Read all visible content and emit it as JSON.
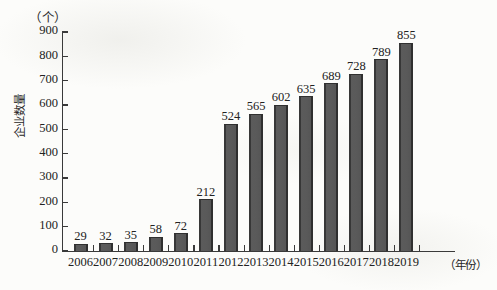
{
  "chart_data": {
    "type": "bar",
    "title": "",
    "unit_label": "（个）",
    "ylabel": "企业数量",
    "xlabel": "（年份）",
    "categories": [
      "2006",
      "2007",
      "2008",
      "2009",
      "2010",
      "2011",
      "2012",
      "2013",
      "2014",
      "2015",
      "2016",
      "2017",
      "2018",
      "2019"
    ],
    "values": [
      29,
      32,
      35,
      58,
      72,
      212,
      524,
      565,
      602,
      635,
      689,
      728,
      789,
      855
    ],
    "value_labels": [
      "29",
      "32",
      "35",
      "58",
      "72",
      "212",
      "524",
      "565",
      "602",
      "635",
      "689",
      "728",
      "789",
      "855"
    ],
    "ylim": [
      0,
      900
    ],
    "ytick_step": 100,
    "ytick_labels": [
      "900",
      "800",
      "700",
      "600",
      "500",
      "400",
      "300",
      "200",
      "100",
      "0"
    ],
    "ytick_values": [
      900,
      800,
      700,
      600,
      500,
      400,
      300,
      200,
      100,
      0
    ],
    "grid": false,
    "legend": false,
    "legend_position": "none",
    "bar_color": "#575757",
    "bar_edge_color": "#303030",
    "axis_color": "#3a3a3a",
    "text_color": "#222222",
    "background_color": "#fcfcfa"
  }
}
